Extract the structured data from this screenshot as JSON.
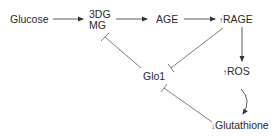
{
  "diagram": {
    "nodes": {
      "glucose": {
        "label": "Glucose"
      },
      "dg3": {
        "label": "3DG"
      },
      "mg": {
        "label": "MG"
      },
      "age": {
        "label": "AGE"
      },
      "rage": {
        "prefix": "↑",
        "label": "RAGE"
      },
      "ros": {
        "prefix": "↑",
        "label": "ROS"
      },
      "glo1": {
        "label": "Glo1"
      },
      "glutathione": {
        "prefix": "↓",
        "label": "Glutathione"
      }
    },
    "edges": [
      {
        "from": "Glucose",
        "to": "3DG/MG",
        "type": "activation"
      },
      {
        "from": "3DG/MG",
        "to": "AGE",
        "type": "activation"
      },
      {
        "from": "AGE",
        "to": "RAGE",
        "type": "activation"
      },
      {
        "from": "RAGE",
        "to": "ROS",
        "type": "activation"
      },
      {
        "from": "ROS",
        "to": "Glutathione",
        "type": "activation"
      },
      {
        "from": "Glo1",
        "to": "3DG/MG",
        "type": "inhibition"
      },
      {
        "from": "RAGE",
        "to": "Glo1",
        "type": "inhibition"
      },
      {
        "from": "Glutathione",
        "to": "Glo1",
        "type": "inhibition"
      }
    ],
    "colors": {
      "line": "#333333",
      "text": "#2a2a2a"
    }
  }
}
